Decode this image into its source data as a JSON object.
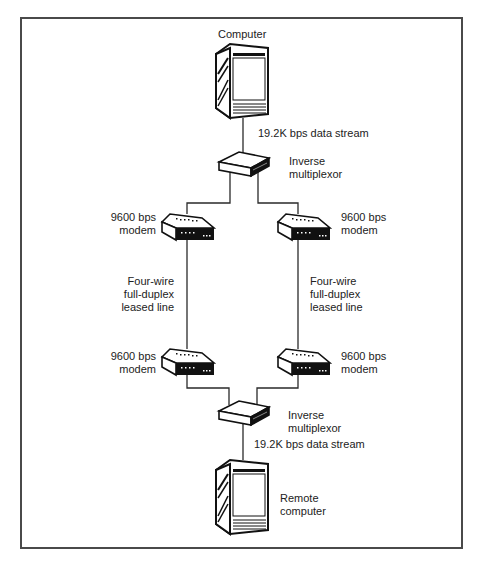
{
  "diagram": {
    "type": "network-topology",
    "nodes": {
      "computer": {
        "label": "Computer"
      },
      "mux_top": {
        "label_line1": "Inverse",
        "label_line2": "multiplexor"
      },
      "modem_tl": {
        "label_line1": "9600 bps",
        "label_line2": "modem"
      },
      "modem_tr": {
        "label_line1": "9600 bps",
        "label_line2": "modem"
      },
      "modem_bl": {
        "label_line1": "9600 bps",
        "label_line2": "modem"
      },
      "modem_br": {
        "label_line1": "9600 bps",
        "label_line2": "modem"
      },
      "mux_bottom": {
        "label_line1": "Inverse",
        "label_line2": "multiplexor"
      },
      "remote": {
        "label_line1": "Remote",
        "label_line2": "computer"
      }
    },
    "links": {
      "top_stream": "19.2K bps data stream",
      "bottom_stream": "19.2K bps data stream",
      "left_line": {
        "l1": "Four-wire",
        "l2": "full-duplex",
        "l3": "leased line"
      },
      "right_line": {
        "l1": "Four-wire",
        "l2": "full-duplex",
        "l3": "leased line"
      }
    },
    "colors": {
      "line": "#2a2a2a",
      "frame": "#4a4a4a",
      "device": "#111111"
    }
  }
}
